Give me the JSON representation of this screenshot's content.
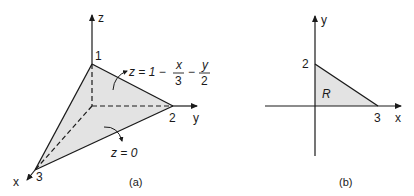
{
  "figure_a": {
    "caption": "(a)",
    "axes": {
      "x": "x",
      "y": "y",
      "z": "z"
    },
    "intercepts": {
      "x": "3",
      "y": "2",
      "z": "1"
    },
    "plane_label": {
      "lhs": "z = 1 −",
      "frac1_num": "x",
      "frac1_den": "3",
      "minus": "−",
      "frac2_num": "y",
      "frac2_den": "2"
    },
    "base_label": "z = 0",
    "fill_color": "#e3e3e3",
    "line_color": "#1a1a1a"
  },
  "figure_b": {
    "caption": "(b)",
    "axes": {
      "x": "x",
      "y": "y"
    },
    "intercepts": {
      "x": "3",
      "y": "2"
    },
    "region_label": "R",
    "fill_color": "#e3e3e3",
    "line_color": "#1a1a1a"
  }
}
